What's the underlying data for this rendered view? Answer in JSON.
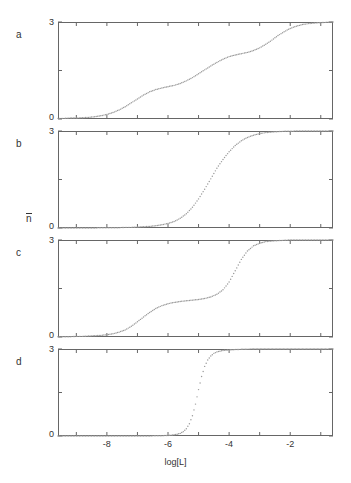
{
  "figure": {
    "yaxis_label_base": "n",
    "xaxis_label": "log[L]",
    "panel_labels": [
      "a",
      "b",
      "c",
      "d"
    ],
    "ytick_labels": [
      "3",
      "0"
    ],
    "xtick_labels": [
      "-8",
      "-6",
      "-4",
      "-2"
    ],
    "dot_color": "#9a9a9a",
    "frame_color": "#666666",
    "text_color": "#333333"
  },
  "chart_data": [
    {
      "type": "scatter",
      "panel": "a",
      "title": "",
      "xlabel": "log[L]",
      "ylabel": "n",
      "xlim": [
        -9.6,
        -0.6
      ],
      "ylim": [
        0,
        3
      ],
      "yticks": [
        0,
        1.5,
        3
      ],
      "ytick_labels": [
        "0",
        "",
        "3"
      ],
      "xticks": [
        -9,
        -8,
        -7,
        -6,
        -5,
        -4,
        -3,
        -2,
        -1
      ],
      "xtick_labels": [
        "",
        "-8",
        "",
        "-6",
        "",
        "-4",
        "",
        "-2",
        ""
      ],
      "grid": false,
      "legend": false,
      "description": "Non-cooperative three-site binding: broad gradual rise from 0 to 3 with shallow inflections",
      "x": [
        -9.6,
        -9.4,
        -9.2,
        -9.0,
        -8.8,
        -8.6,
        -8.4,
        -8.2,
        -8.0,
        -7.8,
        -7.6,
        -7.4,
        -7.2,
        -7.0,
        -6.8,
        -6.6,
        -6.4,
        -6.2,
        -6.0,
        -5.8,
        -5.6,
        -5.4,
        -5.2,
        -5.0,
        -4.8,
        -4.6,
        -4.4,
        -4.2,
        -4.0,
        -3.8,
        -3.6,
        -3.4,
        -3.2,
        -3.0,
        -2.8,
        -2.6,
        -2.4,
        -2.2,
        -2.0,
        -1.8,
        -1.6,
        -1.4,
        -1.2,
        -1.0,
        -0.8,
        -0.6
      ],
      "y": [
        0.02,
        0.02,
        0.03,
        0.03,
        0.04,
        0.05,
        0.07,
        0.1,
        0.14,
        0.2,
        0.28,
        0.38,
        0.5,
        0.62,
        0.74,
        0.84,
        0.91,
        0.96,
        1.0,
        1.04,
        1.1,
        1.18,
        1.28,
        1.4,
        1.52,
        1.64,
        1.75,
        1.85,
        1.93,
        1.98,
        2.02,
        2.06,
        2.12,
        2.2,
        2.31,
        2.44,
        2.58,
        2.7,
        2.8,
        2.87,
        2.92,
        2.95,
        2.97,
        2.98,
        2.99,
        3.0
      ]
    },
    {
      "type": "scatter",
      "panel": "b",
      "title": "",
      "xlabel": "log[L]",
      "ylabel": "n",
      "xlim": [
        -9.6,
        -0.6
      ],
      "ylim": [
        0,
        3
      ],
      "yticks": [
        0,
        1.5,
        3
      ],
      "ytick_labels": [
        "0",
        "",
        "3"
      ],
      "xticks": [
        -9,
        -8,
        -7,
        -6,
        -5,
        -4,
        -3,
        -2,
        -1
      ],
      "xtick_labels": [
        "",
        "-8",
        "",
        "-6",
        "",
        "-4",
        "",
        "-2",
        ""
      ],
      "grid": false,
      "legend": false,
      "description": "Strongly positive cooperative binding: single sharp sigmoid transition centered near log[L] = -4.1",
      "x": [
        -9.6,
        -9.4,
        -9.2,
        -9.0,
        -8.8,
        -8.6,
        -8.4,
        -8.2,
        -8.0,
        -7.8,
        -7.6,
        -7.4,
        -7.2,
        -7.0,
        -6.8,
        -6.6,
        -6.4,
        -6.2,
        -6.0,
        -5.8,
        -5.6,
        -5.4,
        -5.2,
        -5.0,
        -4.8,
        -4.6,
        -4.4,
        -4.2,
        -4.0,
        -3.8,
        -3.6,
        -3.4,
        -3.2,
        -3.0,
        -2.8,
        -2.6,
        -2.4,
        -2.2,
        -2.0,
        -1.8,
        -1.6,
        -1.4,
        -1.2,
        -1.0,
        -0.8,
        -0.6
      ],
      "y": [
        0.0,
        0.0,
        0.0,
        0.0,
        0.0,
        0.0,
        0.0,
        0.01,
        0.01,
        0.01,
        0.01,
        0.02,
        0.02,
        0.03,
        0.04,
        0.05,
        0.07,
        0.1,
        0.14,
        0.2,
        0.3,
        0.44,
        0.64,
        0.9,
        1.2,
        1.52,
        1.85,
        2.12,
        2.36,
        2.55,
        2.7,
        2.8,
        2.87,
        2.92,
        2.95,
        2.97,
        2.98,
        2.99,
        2.99,
        3.0,
        3.0,
        3.0,
        3.0,
        3.0,
        3.0,
        3.0
      ]
    },
    {
      "type": "scatter",
      "panel": "c",
      "title": "",
      "xlabel": "log[L]",
      "ylabel": "n",
      "xlim": [
        -9.6,
        -0.6
      ],
      "ylim": [
        0,
        3
      ],
      "yticks": [
        0,
        1.5,
        3
      ],
      "ytick_labels": [
        "0",
        "",
        "3"
      ],
      "xticks": [
        -9,
        -8,
        -7,
        -6,
        -5,
        -4,
        -3,
        -2,
        -1
      ],
      "xtick_labels": [
        "",
        "-8",
        "",
        "-6",
        "",
        "-4",
        "",
        "-2",
        ""
      ],
      "grid": false,
      "legend": false,
      "description": "Two-step staircase binding: first transition to plateau near 1.15 around log[L] = -6, second sharp rise to 3 near log[L] = -3.6",
      "x": [
        -9.6,
        -9.4,
        -9.2,
        -9.0,
        -8.8,
        -8.6,
        -8.4,
        -8.2,
        -8.0,
        -7.8,
        -7.6,
        -7.4,
        -7.2,
        -7.0,
        -6.8,
        -6.6,
        -6.4,
        -6.2,
        -6.0,
        -5.8,
        -5.6,
        -5.4,
        -5.2,
        -5.0,
        -4.8,
        -4.6,
        -4.4,
        -4.2,
        -4.0,
        -3.8,
        -3.6,
        -3.4,
        -3.2,
        -3.0,
        -2.8,
        -2.6,
        -2.4,
        -2.2,
        -2.0,
        -1.8,
        -1.6,
        -1.4,
        -1.2,
        -1.0,
        -0.8,
        -0.6
      ],
      "y": [
        0.01,
        0.01,
        0.01,
        0.02,
        0.02,
        0.03,
        0.04,
        0.05,
        0.07,
        0.1,
        0.15,
        0.22,
        0.33,
        0.47,
        0.62,
        0.76,
        0.88,
        0.97,
        1.03,
        1.07,
        1.1,
        1.12,
        1.14,
        1.16,
        1.19,
        1.24,
        1.32,
        1.46,
        1.7,
        2.05,
        2.4,
        2.66,
        2.82,
        2.9,
        2.95,
        2.97,
        2.98,
        2.99,
        3.0,
        3.0,
        3.0,
        3.0,
        3.0,
        3.0,
        3.0,
        3.0
      ]
    },
    {
      "type": "scatter",
      "panel": "d",
      "title": "",
      "xlabel": "log[L]",
      "ylabel": "n",
      "xlim": [
        -9.6,
        -0.6
      ],
      "ylim": [
        0,
        3
      ],
      "yticks": [
        0,
        1.5,
        3
      ],
      "ytick_labels": [
        "0",
        "",
        "3"
      ],
      "xticks": [
        -9,
        -8,
        -7,
        -6,
        -5,
        -4,
        -3,
        -2,
        -1
      ],
      "xtick_labels": [
        "",
        "-8",
        "",
        "-6",
        "",
        "-4",
        "",
        "-2",
        ""
      ],
      "grid": false,
      "legend": false,
      "description": "Extreme all-or-none cooperativity: near-vertical step from 0 to 3 at log[L] = -5.1",
      "x": [
        -9.6,
        -9.4,
        -9.2,
        -9.0,
        -8.8,
        -8.6,
        -8.4,
        -8.2,
        -8.0,
        -7.8,
        -7.6,
        -7.4,
        -7.2,
        -7.0,
        -6.8,
        -6.6,
        -6.4,
        -6.2,
        -6.0,
        -5.8,
        -5.7,
        -5.6,
        -5.5,
        -5.4,
        -5.3,
        -5.2,
        -5.1,
        -5.0,
        -4.9,
        -4.8,
        -4.7,
        -4.6,
        -4.5,
        -4.4,
        -4.2,
        -4.0,
        -3.6,
        -3.2,
        -2.8,
        -2.4,
        -2.0,
        -1.6,
        -1.2,
        -0.8,
        -0.6
      ],
      "y": [
        0.0,
        0.0,
        0.0,
        0.0,
        0.0,
        0.0,
        0.0,
        0.0,
        0.0,
        0.0,
        0.0,
        0.0,
        0.0,
        0.0,
        0.0,
        0.0,
        0.01,
        0.01,
        0.02,
        0.04,
        0.06,
        0.09,
        0.15,
        0.25,
        0.42,
        0.7,
        1.1,
        1.6,
        2.05,
        2.4,
        2.62,
        2.76,
        2.85,
        2.9,
        2.95,
        2.97,
        2.99,
        3.0,
        3.0,
        3.0,
        3.0,
        3.0,
        3.0,
        3.0,
        3.0
      ]
    }
  ]
}
